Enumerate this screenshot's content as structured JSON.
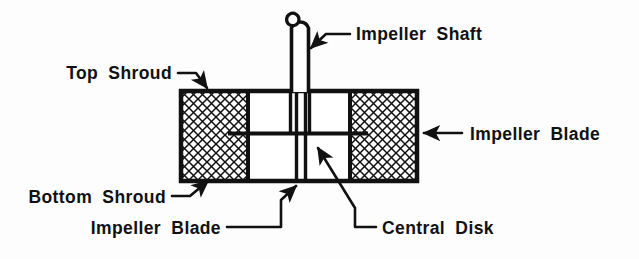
{
  "figure": {
    "kind": "engineering-cross-section",
    "background_color": "#fdfdfd",
    "line_color": "#111111",
    "hatch_color": "#111111"
  },
  "labels": {
    "impeller_shaft": "Impeller Shaft",
    "top_shroud": "Top Shroud",
    "impeller_blade_right": "Impeller Blade",
    "bottom_shroud": "Bottom Shroud",
    "impeller_blade_bottom": "Impeller Blade",
    "central_disk": "Central Disk"
  },
  "parts": {
    "body": {
      "x": 180,
      "y": 90,
      "width": 238,
      "height": 92
    },
    "left_shroud_block": {
      "x": 182,
      "y": 92,
      "width": 66,
      "height": 88
    },
    "right_shroud_block": {
      "x": 350,
      "y": 92,
      "width": 66,
      "height": 88
    },
    "shaft": {
      "x": 290,
      "y": 18,
      "width": 20,
      "height": 74
    },
    "blade_line": {
      "x1": 228,
      "y1": 133,
      "x2": 368,
      "y2": 133
    },
    "central_disk_lines": [
      295,
      306
    ]
  }
}
